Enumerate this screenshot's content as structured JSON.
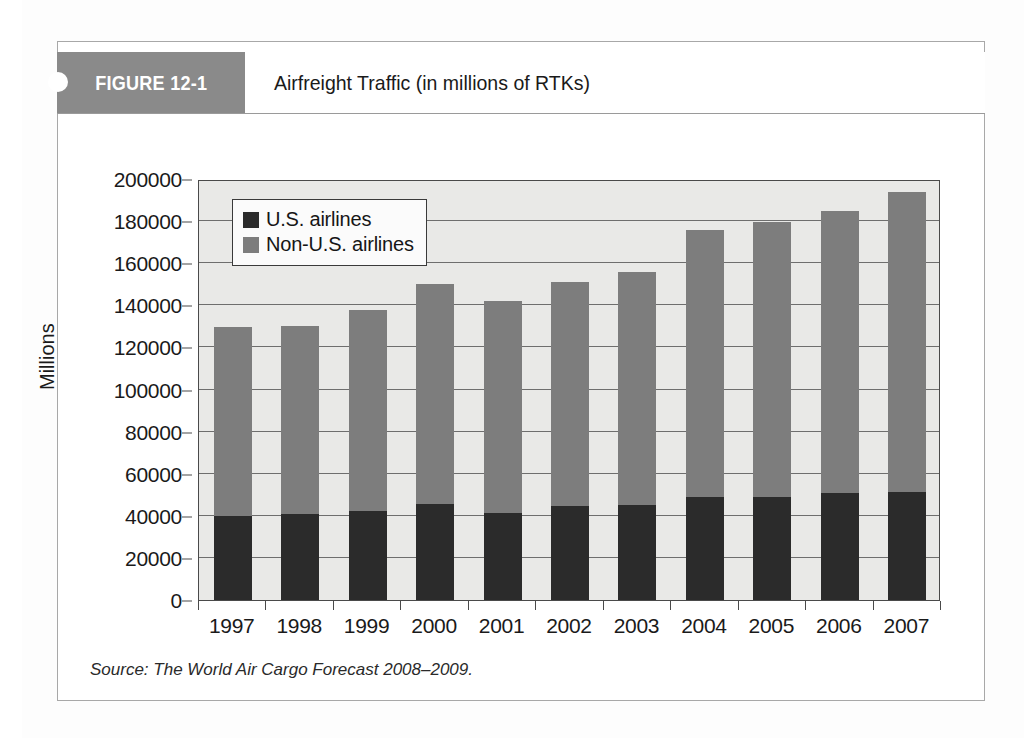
{
  "figure": {
    "tag": "FIGURE 12-1",
    "title": "Airfreight Traffic (in millions of RTKs)",
    "source": "Source: The World Air Cargo Forecast 2008–2009."
  },
  "colors": {
    "us_airlines": "#2b2b2b",
    "non_us_airlines": "#7d7d7d",
    "plot_background": "#e9e9e7",
    "header_band": "#8a8a8a",
    "axis": "#4a4a4a"
  },
  "chart_data": {
    "type": "bar",
    "subtype": "stacked",
    "title": "Airfreight Traffic (in millions of RTKs)",
    "xlabel": "",
    "ylabel": "Millions",
    "ylim": [
      0,
      200000
    ],
    "ytick_step": 20000,
    "yticks": [
      0,
      20000,
      40000,
      60000,
      80000,
      100000,
      120000,
      140000,
      160000,
      180000,
      200000
    ],
    "ytick_labels": [
      "0",
      "20000",
      "40000",
      "60000",
      "80000",
      "100000",
      "120000",
      "140000",
      "160000",
      "180000",
      "200000"
    ],
    "grid": true,
    "legend_position": "upper left",
    "categories": [
      "1997",
      "1998",
      "1999",
      "2000",
      "2001",
      "2002",
      "2003",
      "2004",
      "2005",
      "2006",
      "2007"
    ],
    "series": [
      {
        "name": "U.S. airlines",
        "color": "#2b2b2b",
        "values": [
          40000,
          41000,
          42500,
          45500,
          41500,
          44500,
          45000,
          49000,
          49000,
          51000,
          51500
        ]
      },
      {
        "name": "Non-U.S. airlines",
        "color": "#7d7d7d",
        "values": [
          89500,
          89000,
          95500,
          104500,
          100500,
          106500,
          111000,
          127000,
          130500,
          134000,
          142500
        ]
      }
    ],
    "totals": [
      129500,
      130000,
      138000,
      150000,
      142000,
      151000,
      156000,
      176000,
      179500,
      185000,
      194000
    ]
  }
}
